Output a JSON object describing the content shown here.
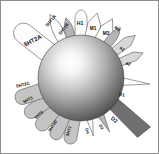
{
  "figure": {
    "center_label": "",
    "colors": {
      "background": "#ffffff",
      "border": "#8e8e8e",
      "sphere_highlight": "#fcfcfc",
      "sphere_mid": "#a9a9a9",
      "sphere_edge": "#4a4a4a",
      "outline": "#555555",
      "fill_white": "#fdfdfd",
      "fill_light_gray": "#d8d8d8",
      "fill_mid_gray": "#b5b5b5",
      "fill_dark_gray": "#6f6f6f",
      "text": "#111111"
    }
  },
  "sphere": {
    "name": "drug-molecule-sphere",
    "cx": 80,
    "cy": 77,
    "r": 43
  },
  "receptors": [
    {
      "id": "5ht2a",
      "label": "5HT2A",
      "shape": "rounded-blade",
      "fill": "#fdfdfd",
      "angle": -142,
      "length": 46,
      "width": 20,
      "label_x": 32,
      "label_y": 40,
      "label_rot": -28,
      "font_size": 6
    },
    {
      "id": "5ht1a",
      "label": "5HT1A",
      "shape": "petal",
      "fill": "#fdfdfd",
      "angle": -116,
      "length": 34,
      "width": 11,
      "label_x": 50,
      "label_y": 20,
      "label_rot": -50,
      "font_size": 4.4
    },
    {
      "id": "5ht1b",
      "label": "5HT1B",
      "shape": "petal-gray",
      "fill": "#b5b5b5",
      "angle": -104,
      "length": 25,
      "width": 10,
      "label_x": 63,
      "label_y": 28,
      "label_rot": -52,
      "font_size": 4.2
    },
    {
      "id": "h1",
      "label": "H1",
      "shape": "tall-oval",
      "fill": "#fdfdfd",
      "angle": -90,
      "length": 36,
      "width": 12,
      "label_x": 79,
      "label_y": 23,
      "label_rot": 0,
      "font_size": 5.2
    },
    {
      "id": "m1",
      "label": "M1",
      "shape": "house",
      "fill": "#fdfdfd",
      "angle": -76,
      "length": 30,
      "width": 13,
      "label_x": 92,
      "label_y": 28,
      "label_rot": 0,
      "font_size": 4.8
    },
    {
      "id": "m3",
      "label": "M3",
      "shape": "house",
      "fill": "#fdfdfd",
      "angle": -62,
      "length": 30,
      "width": 13,
      "label_x": 105,
      "label_y": 33,
      "label_rot": 0,
      "font_size": 4.8
    },
    {
      "id": "m4",
      "label": "M4",
      "shape": "petal-gray",
      "fill": "#b5b5b5",
      "angle": -52,
      "length": 27,
      "width": 10,
      "label_x": 116,
      "label_y": 28,
      "label_rot": 42,
      "font_size": 4.2
    },
    {
      "id": "a1",
      "label": "a1",
      "shape": "blade",
      "fill": "#d8d8d8",
      "angle": -38,
      "length": 32,
      "width": 10,
      "label_x": 121,
      "label_y": 48,
      "label_rot": 40,
      "font_size": 4.6
    },
    {
      "id": "a2",
      "label": "a2",
      "shape": "blade",
      "fill": "#d8d8d8",
      "angle": -22,
      "length": 30,
      "width": 9,
      "label_x": 127,
      "label_y": 63,
      "label_rot": 24,
      "font_size": 4.6
    },
    {
      "id": "d1",
      "label": "D1",
      "shape": "needle",
      "fill": "#fdfdfd",
      "angle": 5,
      "length": 32,
      "width": 11,
      "label_x": 121,
      "label_y": 94,
      "label_rot": 12,
      "font_size": 4.6
    },
    {
      "id": "d2",
      "label": "D2",
      "shape": "big-wedge",
      "fill": "#6f6f6f",
      "angle": 38,
      "length": 48,
      "width": 24,
      "label_x": 113,
      "label_y": 119,
      "label_rot": 38,
      "font_size": 5.4
    },
    {
      "id": "d3",
      "label": "D3",
      "shape": "needle",
      "fill": "#b5b5b5",
      "angle": 62,
      "length": 24,
      "width": 10,
      "label_x": 100,
      "label_y": 126,
      "label_rot": 62,
      "font_size": 4.2
    },
    {
      "id": "d4",
      "label": "D4",
      "shape": "needle",
      "fill": "#fdfdfd",
      "angle": 78,
      "length": 22,
      "width": 10,
      "label_x": 86,
      "label_y": 130,
      "label_rot": 78,
      "font_size": 4.2
    },
    {
      "id": "5ht7",
      "label": "5HT7",
      "shape": "rounded-tab",
      "fill": "#c4c4c4",
      "angle": 100,
      "length": 30,
      "width": 13,
      "label_x": 68,
      "label_y": 130,
      "label_rot": -72,
      "font_size": 4.2
    },
    {
      "id": "5ht1d",
      "label": "5HT1D",
      "shape": "rounded-tab",
      "fill": "#c4c4c4",
      "angle": 114,
      "length": 30,
      "width": 13,
      "label_x": 52,
      "label_y": 125,
      "label_rot": -56,
      "font_size": 4.0
    },
    {
      "id": "5ht6",
      "label": "5HT6",
      "shape": "rounded-tab",
      "fill": "#c4c4c4",
      "angle": 130,
      "length": 30,
      "width": 14,
      "label_x": 38,
      "label_y": 114,
      "label_rot": -42,
      "font_size": 4.2
    },
    {
      "id": "5ht3",
      "label": "5HT3",
      "shape": "rounded-tab",
      "fill": "#c4c4c4",
      "angle": 146,
      "length": 30,
      "width": 14,
      "label_x": 27,
      "label_y": 99,
      "label_rot": -28,
      "font_size": 4.2
    },
    {
      "id": "5ht2c",
      "label": "5HT2C",
      "shape": "rounded-tab",
      "fill": "#c4c4c4",
      "angle": 162,
      "length": 32,
      "width": 15,
      "label_x": 22,
      "label_y": 84,
      "label_rot": -14,
      "font_size": 4.4
    }
  ]
}
